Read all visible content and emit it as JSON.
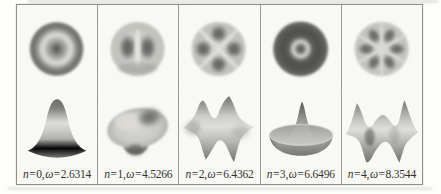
{
  "labels": {
    "n_symbol": "n",
    "omega_symbol": "ω",
    "eq": " = ",
    "comma": ", "
  },
  "panels": [
    {
      "n": "0",
      "omega": "2.6314"
    },
    {
      "n": "1",
      "omega": "4.5266"
    },
    {
      "n": "2",
      "omega": "6.4362"
    },
    {
      "n": "3",
      "omega": "6.6496"
    },
    {
      "n": "4",
      "omega": "8.3544"
    }
  ],
  "colors": {
    "paper": "#fdfdfa",
    "ink": "#2d2d2b",
    "rule_line": "#8e8e8a"
  }
}
